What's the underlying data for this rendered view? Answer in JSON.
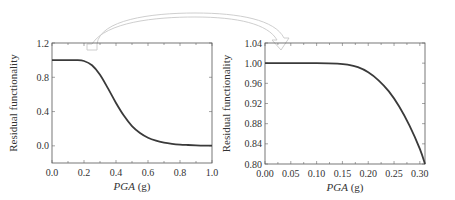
{
  "chart_data": [
    {
      "type": "line",
      "title": "",
      "xlabel": "PGA (g)",
      "xlabel_italic_part": "PGA",
      "xlabel_unit": " (g)",
      "ylabel": "Residual functionality",
      "xlim": [
        0.0,
        1.0
      ],
      "ylim": [
        -0.2,
        1.2
      ],
      "xticks": [
        "0.0",
        "0.2",
        "0.4",
        "0.6",
        "0.8",
        "1.0"
      ],
      "xtick_values": [
        0.0,
        0.2,
        0.4,
        0.6,
        0.8,
        1.0
      ],
      "yticks": [
        "0.0",
        "0.4",
        "0.8",
        "1.2"
      ],
      "ytick_values": [
        0.0,
        0.4,
        0.8,
        1.2
      ],
      "grid": false,
      "series": [
        {
          "name": "Residual functionality",
          "x": [
            0.0,
            0.05,
            0.1,
            0.15,
            0.2,
            0.25,
            0.3,
            0.35,
            0.4,
            0.45,
            0.5,
            0.55,
            0.6,
            0.65,
            0.7,
            0.75,
            0.8,
            0.85,
            0.9,
            0.95,
            1.0
          ],
          "y": [
            1.0,
            1.0,
            1.0,
            1.0,
            0.99,
            0.94,
            0.83,
            0.67,
            0.5,
            0.35,
            0.23,
            0.15,
            0.095,
            0.06,
            0.038,
            0.024,
            0.015,
            0.01,
            0.006,
            0.003,
            0.002
          ]
        }
      ]
    },
    {
      "type": "line",
      "title": "",
      "xlabel": "PGA (g)",
      "xlabel_italic_part": "PGA",
      "xlabel_unit": " (g)",
      "ylabel": "Residual functionality",
      "xlim": [
        0.0,
        0.31
      ],
      "ylim": [
        0.8,
        1.04
      ],
      "xticks": [
        "0.00",
        "0.05",
        "0.10",
        "0.15",
        "0.20",
        "0.25",
        "0.30"
      ],
      "xtick_values": [
        0.0,
        0.05,
        0.1,
        0.15,
        0.2,
        0.25,
        0.3
      ],
      "yticks": [
        "0.80",
        "0.84",
        "0.88",
        "0.92",
        "0.96",
        "1.00",
        "1.04"
      ],
      "ytick_values": [
        0.8,
        0.84,
        0.88,
        0.92,
        0.96,
        1.0,
        1.04
      ],
      "grid": false,
      "series": [
        {
          "name": "Residual functionality (zoomed)",
          "x": [
            0.0,
            0.05,
            0.1,
            0.14,
            0.16,
            0.18,
            0.2,
            0.22,
            0.24,
            0.26,
            0.28,
            0.3,
            0.31
          ],
          "y": [
            1.0,
            1.0,
            1.0,
            0.999,
            0.997,
            0.992,
            0.982,
            0.966,
            0.944,
            0.914,
            0.876,
            0.83,
            0.8
          ]
        }
      ]
    }
  ],
  "annotation": {
    "arrow": "curved arrow from left plot (PGA ≈ 0.25 region) to right zoomed plot",
    "arrow_color": "#c8c8c8"
  }
}
